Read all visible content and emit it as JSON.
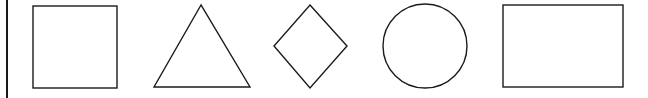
{
  "diagram": {
    "colors": {
      "stroke": "#1a1a1a",
      "background": "#ffffff"
    },
    "shapes": [
      {
        "id": "square",
        "label": "square"
      },
      {
        "id": "triangle",
        "label": "triangle"
      },
      {
        "id": "diamond",
        "label": "diamond"
      },
      {
        "id": "circle",
        "label": "circle"
      },
      {
        "id": "rectangle",
        "label": "rectangle"
      }
    ]
  }
}
